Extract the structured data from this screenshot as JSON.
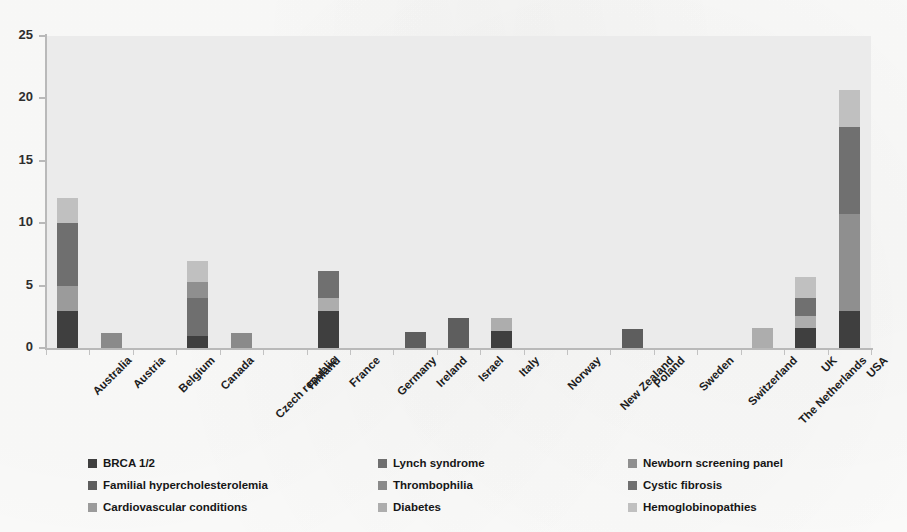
{
  "chart_data": {
    "type": "bar",
    "stacked": true,
    "title": "",
    "xlabel": "",
    "ylabel": "",
    "ylim": [
      0,
      25
    ],
    "yticks": [
      0,
      5,
      10,
      15,
      20,
      25
    ],
    "grid": false,
    "legend_position": "bottom",
    "categories": [
      "Australia",
      "Austria",
      "Belgium",
      "Canada",
      "Czech republic",
      "Finland",
      "France",
      "Germany",
      "Ireland",
      "Israel",
      "Italy",
      "Norway",
      "New Zealand",
      "Poland",
      "Sweden",
      "Switzerland",
      "The Netherlands",
      "UK",
      "USA"
    ],
    "series": [
      {
        "name": "BRCA 1/2",
        "color": "#3f3f3f",
        "values": [
          3,
          0,
          0,
          1,
          0,
          0,
          3,
          0,
          0,
          0,
          1.4,
          0,
          0,
          0,
          0,
          0,
          0,
          1.6,
          3
        ]
      },
      {
        "name": "Familial hypercholesterolemia",
        "color": "#5e5e5e",
        "values": [
          0,
          0,
          0,
          0,
          0,
          0,
          0,
          0,
          1.3,
          2.4,
          0,
          0,
          0,
          1.5,
          0,
          0,
          0,
          0,
          0
        ]
      },
      {
        "name": "Cardiovascular conditions",
        "color": "#9b9b9b",
        "values": [
          2,
          0,
          0,
          0,
          0,
          0,
          0,
          0,
          0,
          0,
          0,
          0,
          0,
          0,
          0,
          0,
          0,
          0,
          0
        ]
      },
      {
        "name": "Lynch syndrome",
        "color": "#6f6f6f",
        "values": [
          5,
          0,
          0,
          3,
          0,
          0,
          0,
          0,
          0,
          0,
          0,
          0,
          0,
          0,
          0,
          0,
          0,
          0,
          0
        ]
      },
      {
        "name": "Thrombophilia",
        "color": "#8a8a8a",
        "values": [
          0,
          1.2,
          0,
          0,
          1.2,
          0,
          0,
          0,
          0,
          0,
          0,
          0,
          0,
          0,
          0,
          0,
          0,
          0,
          0
        ]
      },
      {
        "name": "Diabetes",
        "color": "#adadad",
        "values": [
          0,
          0,
          0,
          0,
          0,
          0,
          1,
          0,
          0,
          0,
          1,
          0,
          0,
          0,
          0,
          0,
          1.6,
          1,
          0
        ]
      },
      {
        "name": "Newborn screening panel",
        "color": "#8f8f8f",
        "values": [
          0,
          0,
          0,
          1.3,
          0,
          0,
          0,
          0,
          0,
          0,
          0,
          0,
          0,
          0,
          0,
          0,
          0,
          0,
          7.7
        ]
      },
      {
        "name": "Cystic fibrosis",
        "color": "#707070",
        "values": [
          0,
          0,
          0,
          0,
          0,
          0,
          2.2,
          0,
          0,
          0,
          0,
          0,
          0,
          0,
          0,
          0,
          0,
          1.4,
          7
        ]
      },
      {
        "name": "Hemoglobinopathies",
        "color": "#c0c0c0",
        "values": [
          2,
          0,
          0,
          1.7,
          0,
          0,
          0,
          0,
          0,
          0,
          0,
          0,
          0,
          0,
          0,
          0,
          0,
          1.7,
          3
        ]
      }
    ],
    "totals": [
      12,
      1.2,
      0,
      7,
      1.2,
      0,
      6.2,
      0,
      1.3,
      2.4,
      2.4,
      0,
      0,
      1.5,
      0,
      0,
      1.6,
      5.7,
      20.7
    ]
  },
  "legend": {
    "items": [
      {
        "label": "BRCA 1/2",
        "color": "#3f3f3f"
      },
      {
        "label": "Familial hypercholesterolemia",
        "color": "#5e5e5e"
      },
      {
        "label": "Cardiovascular conditions",
        "color": "#9b9b9b"
      },
      {
        "label": "Lynch syndrome",
        "color": "#6f6f6f"
      },
      {
        "label": "Thrombophilia",
        "color": "#8a8a8a"
      },
      {
        "label": "Diabetes",
        "color": "#adadad"
      },
      {
        "label": "Newborn screening panel",
        "color": "#8f8f8f"
      },
      {
        "label": "Cystic fibrosis",
        "color": "#707070"
      },
      {
        "label": "Hemoglobinopathies",
        "color": "#c0c0c0"
      }
    ]
  },
  "axis": {
    "y_tick_labels": [
      "0",
      "5",
      "10",
      "15",
      "20",
      "25"
    ],
    "y_max": 25,
    "axis_color": "#b9b9b9",
    "plot_bg": "#ebebeb"
  }
}
